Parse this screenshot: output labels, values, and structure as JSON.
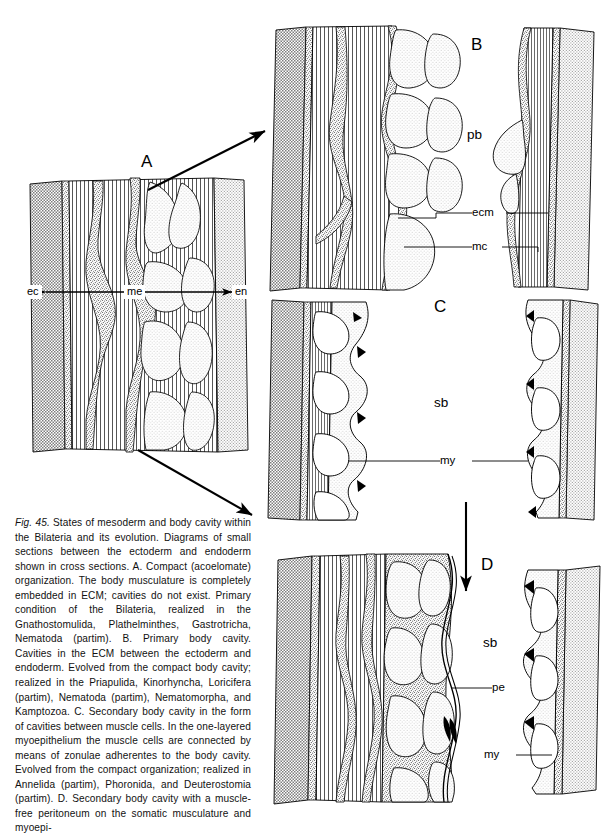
{
  "figure": {
    "number": "Fig. 45.",
    "caption_text": " States of mesoderm and body cavity within the Bilateria and its evolution. Diagrams of small sections between the ectoderm and endoderm shown in cross sections. A. Compact (acoelomate) organization. The body musculature is completely embedded in ECM; cavities do not exist. Primary condition of the Bilateria, realized in the Gnathostomulida, Plathelminthes, Gastrotricha, Nematoda (partim). B. Primary body cavity. Cavities in the ECM between the ectoderm and endoderm. Evolved from the compact body cavity; realized in the Priapulida, Kinorhyncha, Loricifera (partim), Nematoda (partim), Nematomorpha, and Kamptozoa. C. Secondary body cavity in the form of cavities between muscle cells. In the one-layered myoepithelium the muscle cells are connected by means of zonulae adherentes to the body cavity. Evolved from the compact organization; realized in Annelida (partim), Phoronida, and Deuterostomia (partim). D. Secondary body cavity with a muscle-free peritoneum on the somatic musculature and myoepi-"
  },
  "panels": {
    "a": {
      "letter": "A",
      "labels": {
        "ectoderm": "ec",
        "mesoderm": "me",
        "endoderm": "en"
      }
    },
    "b": {
      "letter": "B",
      "labels": {
        "primary_body_cavity": "pb",
        "extracellular_matrix": "ecm",
        "muscle_cell": "mc"
      }
    },
    "c": {
      "letter": "C",
      "labels": {
        "secondary_body_cavity": "sb",
        "myoepithelium": "my"
      }
    },
    "d": {
      "letter": "D",
      "labels": {
        "secondary_body_cavity": "sb",
        "peritoneum": "pe",
        "myoepithelium": "my"
      }
    }
  },
  "arrows": [
    {
      "name": "arrow-a-to-b",
      "direction": "up-right"
    },
    {
      "name": "arrow-a-to-d",
      "direction": "down-right"
    },
    {
      "name": "arrow-c-to-d",
      "direction": "down"
    }
  ],
  "colors": {
    "ink": "#000000",
    "ectoderm_fill": "#9a9a9a",
    "endoderm_fill": "#e3e3e3",
    "ecm_fill": "#f0f0f0",
    "cell_fill": "#f2f2f2",
    "background": "#ffffff"
  }
}
